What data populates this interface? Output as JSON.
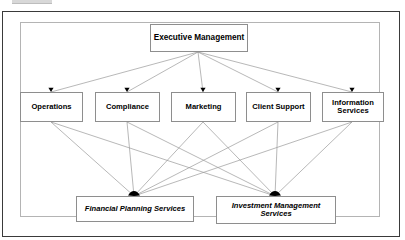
{
  "diagram": {
    "type": "organizational-hierarchy",
    "colors": {
      "outer_frame_border": "#3a3a3a",
      "inner_frame_border": "#b4b4b4",
      "node_border": "#8e8e8e",
      "node_fill": "#ffffff",
      "edge_line": "#9a9a9a",
      "arrowhead": "#000000",
      "text": "#000000",
      "background": "#ffffff"
    },
    "levels": [
      {
        "name": "executive",
        "nodes": [
          {
            "id": "executive-management",
            "label": "Executive Management",
            "x": 150,
            "y": 24,
            "w": 98,
            "h": 28,
            "style": "bold"
          }
        ]
      },
      {
        "name": "departments",
        "nodes": [
          {
            "id": "operations",
            "label": "Operations",
            "x": 20,
            "y": 92,
            "w": 63,
            "h": 30,
            "style": "bold"
          },
          {
            "id": "compliance",
            "label": "Compliance",
            "x": 95,
            "y": 92,
            "w": 65,
            "h": 30,
            "style": "bold"
          },
          {
            "id": "marketing",
            "label": "Marketing",
            "x": 171,
            "y": 92,
            "w": 65,
            "h": 30,
            "style": "bold"
          },
          {
            "id": "client-support",
            "label": "Client Support",
            "x": 246,
            "y": 92,
            "w": 65,
            "h": 30,
            "style": "bold"
          },
          {
            "id": "information-services",
            "label": "Information\nServices",
            "x": 322,
            "y": 92,
            "w": 62,
            "h": 30,
            "style": "bold"
          }
        ]
      },
      {
        "name": "services",
        "nodes": [
          {
            "id": "financial-planning-services",
            "label": "Financial Planning Services",
            "x": 76,
            "y": 196,
            "w": 118,
            "h": 26,
            "style": "bold-italic"
          },
          {
            "id": "investment-management-services",
            "label": "Investment Management\nServices",
            "x": 216,
            "y": 196,
            "w": 120,
            "h": 28,
            "style": "bold-italic"
          }
        ]
      }
    ],
    "edges": [
      {
        "from": "executive-management",
        "to": "operations",
        "x1": 198,
        "y1": 52,
        "x2": 51,
        "y2": 92
      },
      {
        "from": "executive-management",
        "to": "compliance",
        "x1": 198,
        "y1": 52,
        "x2": 127,
        "y2": 92
      },
      {
        "from": "executive-management",
        "to": "marketing",
        "x1": 198,
        "y1": 52,
        "x2": 203,
        "y2": 92
      },
      {
        "from": "executive-management",
        "to": "client-support",
        "x1": 198,
        "y1": 52,
        "x2": 278,
        "y2": 92
      },
      {
        "from": "executive-management",
        "to": "information-services",
        "x1": 198,
        "y1": 52,
        "x2": 352,
        "y2": 92
      },
      {
        "from": "operations",
        "to": "financial-planning-services",
        "x1": 51,
        "y1": 122,
        "x2": 134,
        "y2": 196
      },
      {
        "from": "operations",
        "to": "investment-management-services",
        "x1": 51,
        "y1": 122,
        "x2": 275,
        "y2": 196
      },
      {
        "from": "compliance",
        "to": "financial-planning-services",
        "x1": 127,
        "y1": 122,
        "x2": 134,
        "y2": 196
      },
      {
        "from": "compliance",
        "to": "investment-management-services",
        "x1": 127,
        "y1": 122,
        "x2": 275,
        "y2": 196
      },
      {
        "from": "marketing",
        "to": "financial-planning-services",
        "x1": 203,
        "y1": 122,
        "x2": 134,
        "y2": 196
      },
      {
        "from": "marketing",
        "to": "investment-management-services",
        "x1": 203,
        "y1": 122,
        "x2": 275,
        "y2": 196
      },
      {
        "from": "client-support",
        "to": "financial-planning-services",
        "x1": 278,
        "y1": 122,
        "x2": 134,
        "y2": 196
      },
      {
        "from": "client-support",
        "to": "investment-management-services",
        "x1": 278,
        "y1": 122,
        "x2": 275,
        "y2": 196
      },
      {
        "from": "information-services",
        "to": "financial-planning-services",
        "x1": 352,
        "y1": 122,
        "x2": 134,
        "y2": 196
      },
      {
        "from": "information-services",
        "to": "investment-management-services",
        "x1": 352,
        "y1": 122,
        "x2": 275,
        "y2": 196
      }
    ],
    "arrowheads_small": [
      {
        "target": "operations",
        "x": 51,
        "y": 92
      },
      {
        "target": "compliance",
        "x": 127,
        "y": 92
      },
      {
        "target": "marketing",
        "x": 203,
        "y": 92
      },
      {
        "target": "client-support",
        "x": 278,
        "y": 92
      },
      {
        "target": "information-services",
        "x": 352,
        "y": 92
      }
    ],
    "arrowheads_large": [
      {
        "target": "financial-planning-services",
        "x": 134,
        "y": 196
      },
      {
        "target": "investment-management-services",
        "x": 275,
        "y": 196
      }
    ]
  }
}
